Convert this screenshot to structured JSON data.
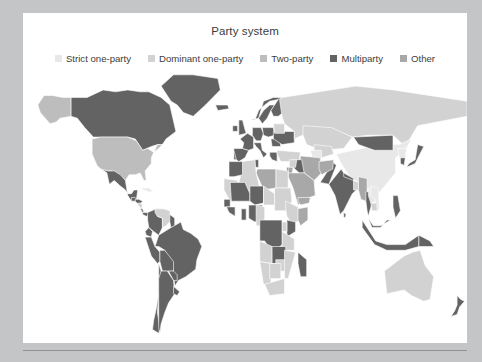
{
  "title": "Party system",
  "legend": {
    "items": [
      {
        "label": "Strict one-party",
        "color": "#e8e8e8"
      },
      {
        "label": "Dominant one-party",
        "color": "#d2d2d2"
      },
      {
        "label": "Two-party",
        "color": "#bdbdbd"
      },
      {
        "label": "Multiparty",
        "color": "#636363"
      },
      {
        "label": "Other",
        "color": "#a8a8a8"
      }
    ]
  },
  "colors": {
    "page_background": "#c3c5c6",
    "card_background": "#ffffff",
    "ocean": "#ffffff",
    "text": "#3c3c3c",
    "rule": "#8e9091",
    "strict_one_party": "#e8e8e8",
    "dominant_one_party": "#d2d2d2",
    "two_party": "#bdbdbd",
    "multiparty": "#636363",
    "other": "#a8a8a8"
  },
  "chart_data": {
    "type": "map",
    "title": "Party system",
    "projection": "equirectangular",
    "legend_position": "top",
    "categories": [
      "Strict one-party",
      "Dominant one-party",
      "Two-party",
      "Multiparty",
      "Other"
    ],
    "category_colors": [
      "#e8e8e8",
      "#d2d2d2",
      "#bdbdbd",
      "#636363",
      "#a8a8a8"
    ],
    "regions": [
      {
        "name": "Canada",
        "category": "Multiparty"
      },
      {
        "name": "United States",
        "category": "Two-party"
      },
      {
        "name": "Alaska",
        "category": "Two-party"
      },
      {
        "name": "Mexico",
        "category": "Multiparty"
      },
      {
        "name": "Greenland",
        "category": "Multiparty"
      },
      {
        "name": "Guatemala",
        "category": "Multiparty"
      },
      {
        "name": "Honduras",
        "category": "Multiparty"
      },
      {
        "name": "Nicaragua",
        "category": "Dominant one-party"
      },
      {
        "name": "Costa Rica",
        "category": "Multiparty"
      },
      {
        "name": "Panama",
        "category": "Multiparty"
      },
      {
        "name": "Cuba",
        "category": "Strict one-party"
      },
      {
        "name": "Colombia",
        "category": "Multiparty"
      },
      {
        "name": "Venezuela",
        "category": "Dominant one-party"
      },
      {
        "name": "Guyana",
        "category": "Multiparty"
      },
      {
        "name": "Ecuador",
        "category": "Multiparty"
      },
      {
        "name": "Peru",
        "category": "Multiparty"
      },
      {
        "name": "Brazil",
        "category": "Multiparty"
      },
      {
        "name": "Bolivia",
        "category": "Multiparty"
      },
      {
        "name": "Paraguay",
        "category": "Multiparty"
      },
      {
        "name": "Chile",
        "category": "Multiparty"
      },
      {
        "name": "Argentina",
        "category": "Multiparty"
      },
      {
        "name": "Uruguay",
        "category": "Multiparty"
      },
      {
        "name": "United Kingdom",
        "category": "Multiparty"
      },
      {
        "name": "Ireland",
        "category": "Multiparty"
      },
      {
        "name": "France",
        "category": "Multiparty"
      },
      {
        "name": "Spain",
        "category": "Multiparty"
      },
      {
        "name": "Portugal",
        "category": "Multiparty"
      },
      {
        "name": "Germany",
        "category": "Multiparty"
      },
      {
        "name": "Poland",
        "category": "Multiparty"
      },
      {
        "name": "Italy",
        "category": "Multiparty"
      },
      {
        "name": "Norway",
        "category": "Multiparty"
      },
      {
        "name": "Sweden",
        "category": "Multiparty"
      },
      {
        "name": "Finland",
        "category": "Multiparty"
      },
      {
        "name": "Iceland",
        "category": "Multiparty"
      },
      {
        "name": "Ukraine",
        "category": "Multiparty"
      },
      {
        "name": "Belarus",
        "category": "Dominant one-party"
      },
      {
        "name": "Romania",
        "category": "Multiparty"
      },
      {
        "name": "Greece",
        "category": "Multiparty"
      },
      {
        "name": "Turkey",
        "category": "Dominant one-party"
      },
      {
        "name": "Russia",
        "category": "Dominant one-party"
      },
      {
        "name": "Kazakhstan",
        "category": "Dominant one-party"
      },
      {
        "name": "Uzbekistan",
        "category": "Dominant one-party"
      },
      {
        "name": "Turkmenistan",
        "category": "Strict one-party"
      },
      {
        "name": "Iran",
        "category": "Other"
      },
      {
        "name": "Iraq",
        "category": "Multiparty"
      },
      {
        "name": "Saudi Arabia",
        "category": "Other"
      },
      {
        "name": "Yemen",
        "category": "Other"
      },
      {
        "name": "Syria",
        "category": "Dominant one-party"
      },
      {
        "name": "Israel",
        "category": "Multiparty"
      },
      {
        "name": "Jordan",
        "category": "Other"
      },
      {
        "name": "Egypt",
        "category": "Dominant one-party"
      },
      {
        "name": "Libya",
        "category": "Other"
      },
      {
        "name": "Algeria",
        "category": "Dominant one-party"
      },
      {
        "name": "Morocco",
        "category": "Multiparty"
      },
      {
        "name": "Tunisia",
        "category": "Multiparty"
      },
      {
        "name": "Mauritania",
        "category": "Dominant one-party"
      },
      {
        "name": "Mali",
        "category": "Multiparty"
      },
      {
        "name": "Niger",
        "category": "Multiparty"
      },
      {
        "name": "Chad",
        "category": "Dominant one-party"
      },
      {
        "name": "Sudan",
        "category": "Dominant one-party"
      },
      {
        "name": "Ethiopia",
        "category": "Dominant one-party"
      },
      {
        "name": "Somalia",
        "category": "Other"
      },
      {
        "name": "Kenya",
        "category": "Multiparty"
      },
      {
        "name": "Tanzania",
        "category": "Dominant one-party"
      },
      {
        "name": "Uganda",
        "category": "Dominant one-party"
      },
      {
        "name": "Nigeria",
        "category": "Multiparty"
      },
      {
        "name": "Ghana",
        "category": "Multiparty"
      },
      {
        "name": "Senegal",
        "category": "Multiparty"
      },
      {
        "name": "Guinea",
        "category": "Multiparty"
      },
      {
        "name": "Cameroon",
        "category": "Dominant one-party"
      },
      {
        "name": "Democratic Republic of the Congo",
        "category": "Multiparty"
      },
      {
        "name": "Angola",
        "category": "Dominant one-party"
      },
      {
        "name": "Zambia",
        "category": "Multiparty"
      },
      {
        "name": "Zimbabwe",
        "category": "Dominant one-party"
      },
      {
        "name": "Mozambique",
        "category": "Dominant one-party"
      },
      {
        "name": "Madagascar",
        "category": "Multiparty"
      },
      {
        "name": "South Africa",
        "category": "Dominant one-party"
      },
      {
        "name": "Namibia",
        "category": "Dominant one-party"
      },
      {
        "name": "Botswana",
        "category": "Dominant one-party"
      },
      {
        "name": "China",
        "category": "Strict one-party"
      },
      {
        "name": "Mongolia",
        "category": "Multiparty"
      },
      {
        "name": "North Korea",
        "category": "Strict one-party"
      },
      {
        "name": "South Korea",
        "category": "Multiparty"
      },
      {
        "name": "Japan",
        "category": "Multiparty"
      },
      {
        "name": "India",
        "category": "Multiparty"
      },
      {
        "name": "Pakistan",
        "category": "Multiparty"
      },
      {
        "name": "Afghanistan",
        "category": "Other"
      },
      {
        "name": "Nepal",
        "category": "Multiparty"
      },
      {
        "name": "Bangladesh",
        "category": "Dominant one-party"
      },
      {
        "name": "Myanmar",
        "category": "Other"
      },
      {
        "name": "Thailand",
        "category": "Multiparty"
      },
      {
        "name": "Vietnam",
        "category": "Strict one-party"
      },
      {
        "name": "Laos",
        "category": "Strict one-party"
      },
      {
        "name": "Cambodia",
        "category": "Dominant one-party"
      },
      {
        "name": "Malaysia",
        "category": "Multiparty"
      },
      {
        "name": "Indonesia",
        "category": "Multiparty"
      },
      {
        "name": "Philippines",
        "category": "Multiparty"
      },
      {
        "name": "Papua New Guinea",
        "category": "Multiparty"
      },
      {
        "name": "Australia",
        "category": "Dominant one-party"
      },
      {
        "name": "New Zealand",
        "category": "Multiparty"
      },
      {
        "name": "Sri Lanka",
        "category": "Multiparty"
      }
    ]
  }
}
